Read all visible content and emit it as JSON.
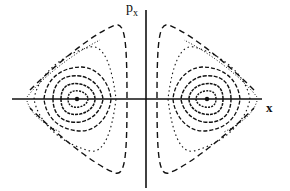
{
  "diagram": {
    "type": "phase-space-poincare-section",
    "axes": {
      "horizontal": {
        "label": "x"
      },
      "vertical": {
        "label_base": "p",
        "label_sub": "x"
      }
    },
    "fixed_points": [
      {
        "name": "left-center",
        "position": "left of p_x axis on x axis"
      },
      {
        "name": "right-center",
        "position": "right of p_x axis on x axis"
      }
    ],
    "orbit_families": [
      {
        "side": "left",
        "closed_orbits": 5,
        "outer_separatrix_style": "dashed",
        "chaotic_scatter": "dotted"
      },
      {
        "side": "right",
        "closed_orbits": 5,
        "outer_separatrix_style": "dashed",
        "chaotic_scatter": "dotted"
      }
    ],
    "colors": {
      "ink": "#111111",
      "background": "#ffffff"
    }
  }
}
